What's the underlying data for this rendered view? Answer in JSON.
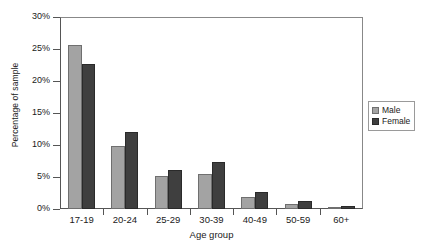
{
  "chart_data": {
    "type": "bar",
    "title": "",
    "xlabel": "Age group",
    "ylabel": "Percentage of sample",
    "categories": [
      "17-19",
      "20-24",
      "25-29",
      "30-39",
      "40-49",
      "50-59",
      "60+"
    ],
    "series": [
      {
        "name": "Male",
        "color": "#a3a3a3",
        "values": [
          25.7,
          9.9,
          5.2,
          5.5,
          1.8,
          0.8,
          0.3
        ]
      },
      {
        "name": "Female",
        "color": "#3f3f3f",
        "values": [
          22.6,
          12.0,
          6.1,
          7.4,
          2.7,
          1.3,
          0.5
        ]
      }
    ],
    "ylim": [
      0,
      30
    ],
    "yticks": [
      0,
      5,
      10,
      15,
      20,
      25,
      30
    ],
    "ytick_labels": [
      "0%",
      "5%",
      "10%",
      "15%",
      "20%",
      "25%",
      "30%"
    ],
    "grid": false,
    "legend_position": "right"
  },
  "legend": {
    "entries": [
      {
        "label": "Male"
      },
      {
        "label": "Female"
      }
    ]
  }
}
